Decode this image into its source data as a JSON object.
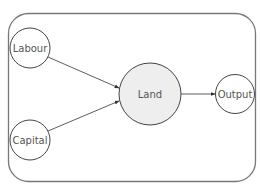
{
  "diagram": {
    "colors": {
      "frame": "#777777",
      "node_stroke": "#444444",
      "node_fill": "#ffffff",
      "center_fill": "#eeeeee",
      "edge": "#333333",
      "text": "#555555"
    },
    "nodes": [
      {
        "id": "labour",
        "label": "Labour"
      },
      {
        "id": "capital",
        "label": "Capital"
      },
      {
        "id": "land",
        "label": "Land"
      },
      {
        "id": "output",
        "label": "Output"
      }
    ],
    "edges": [
      {
        "from": "labour",
        "to": "land"
      },
      {
        "from": "capital",
        "to": "land"
      },
      {
        "from": "land",
        "to": "output"
      }
    ]
  }
}
